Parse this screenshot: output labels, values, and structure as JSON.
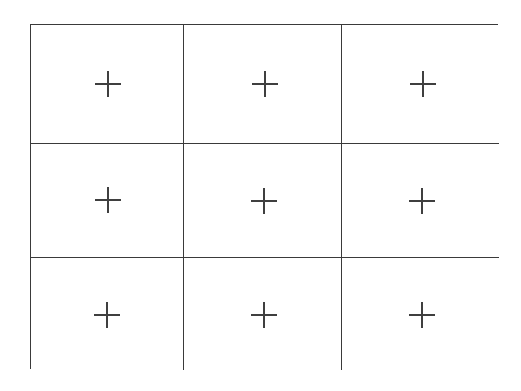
{
  "figure": {
    "background_color": "#ffffff",
    "line_color": "#3a3a3a",
    "mark_color": "#3f3f3f",
    "border_width_px": 2,
    "outer_rect": {
      "x": 30,
      "y": 24,
      "width": 468,
      "height": 345
    },
    "grid": {
      "rows": 3,
      "columns": 3,
      "column_widths_px": [
        153,
        158,
        157
      ],
      "row_heights_px": [
        119,
        114,
        112
      ],
      "vertical_divider_x_px": [
        183,
        341
      ],
      "horizontal_divider_y_px": [
        143,
        257
      ]
    },
    "mark": {
      "glyph": "plus",
      "icon_name": "crosshair-plus-icon",
      "size_px": 26,
      "stroke_px": 1.5
    },
    "cells": [
      {
        "id": "cell-r1-c1",
        "row": 1,
        "column": 1,
        "mark": "+",
        "center_x": 107,
        "center_y": 83
      },
      {
        "id": "cell-r1-c2",
        "row": 1,
        "column": 2,
        "mark": "+",
        "center_x": 264,
        "center_y": 83
      },
      {
        "id": "cell-r1-c3",
        "row": 1,
        "column": 3,
        "mark": "+",
        "center_x": 422,
        "center_y": 83
      },
      {
        "id": "cell-r2-c1",
        "row": 2,
        "column": 1,
        "mark": "+",
        "center_x": 107,
        "center_y": 199
      },
      {
        "id": "cell-r2-c2",
        "row": 2,
        "column": 2,
        "mark": "+",
        "center_x": 263,
        "center_y": 200
      },
      {
        "id": "cell-r2-c3",
        "row": 2,
        "column": 3,
        "mark": "+",
        "center_x": 421,
        "center_y": 200
      },
      {
        "id": "cell-r3-c1",
        "row": 3,
        "column": 1,
        "mark": "+",
        "center_x": 106,
        "center_y": 314
      },
      {
        "id": "cell-r3-c2",
        "row": 3,
        "column": 2,
        "mark": "+",
        "center_x": 263,
        "center_y": 314
      },
      {
        "id": "cell-r3-c3",
        "row": 3,
        "column": 3,
        "mark": "+",
        "center_x": 421,
        "center_y": 314
      }
    ]
  }
}
